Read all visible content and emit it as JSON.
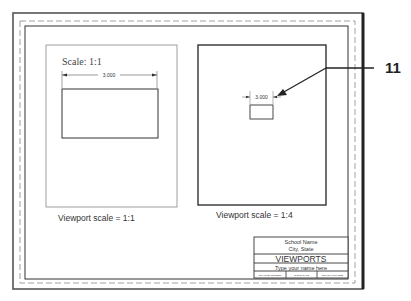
{
  "drawing": {
    "callout_number": "11",
    "left_viewport": {
      "scale_note": "Scale: 1:1",
      "dimension": "3.000",
      "caption": "Viewport scale = 1:1"
    },
    "right_viewport": {
      "dimension": "3.000",
      "caption": "Viewport scale = 1:4"
    },
    "title_block": {
      "school_name": "School Name",
      "city_state": "City, State",
      "title": "VIEWPORTS",
      "name_field": "Type your name here",
      "bottom_cells": [
        "DRAWING NUMBER",
        "CHECK DATE",
        "SCALE: FULL SIZE"
      ]
    },
    "colors": {
      "line": "#222222",
      "thin_line": "#666666",
      "text": "#333333"
    }
  }
}
